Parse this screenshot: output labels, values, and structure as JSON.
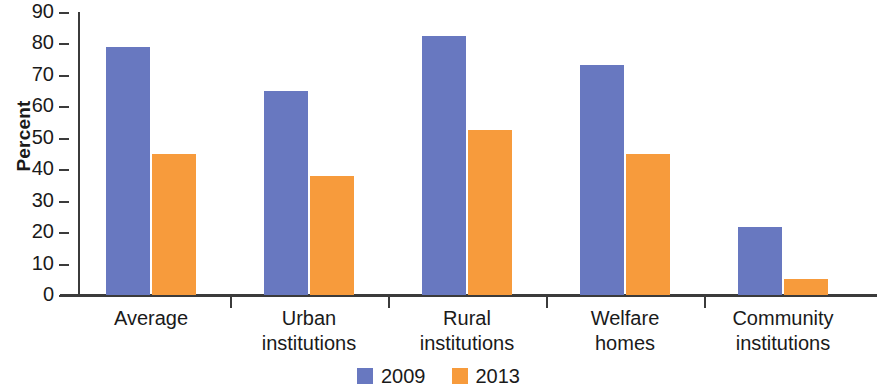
{
  "chart_data": {
    "type": "bar",
    "title": "",
    "xlabel": "",
    "ylabel": "Percent",
    "ylim": [
      0,
      90
    ],
    "ytick_step": 10,
    "yticks": [
      90,
      80,
      70,
      60,
      50,
      40,
      30,
      20,
      10,
      0
    ],
    "grid": false,
    "legend_position": "bottom-center",
    "categories": [
      "Average",
      "Urban institutions",
      "Rural institutions",
      "Welfare homes",
      "Community institutions"
    ],
    "category_lines": [
      [
        "Average"
      ],
      [
        "Urban",
        "institutions"
      ],
      [
        "Rural",
        "institutions"
      ],
      [
        "Welfare",
        "homes"
      ],
      [
        "Community",
        "institutions"
      ]
    ],
    "series": [
      {
        "name": "2009",
        "color": "#6878c0",
        "values": [
          79,
          65,
          82.5,
          73,
          21.5
        ]
      },
      {
        "name": "2013",
        "color": "#f79b3c",
        "values": [
          45,
          38,
          52.5,
          45,
          5
        ]
      }
    ]
  },
  "axis": {
    "y_title": "Percent"
  },
  "colors": {
    "series_2009": "#6878c0",
    "series_2013": "#f79b3c",
    "axis": "#3b3b3b",
    "text": "#1a1a1a",
    "background": "#ffffff"
  }
}
